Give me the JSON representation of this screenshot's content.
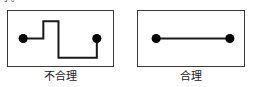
{
  "figure": {
    "clipped_header_text": "小。",
    "background_color": "#ffffff",
    "stroke_color": "#1a1a1a",
    "border_color": "#3a3a3a"
  },
  "panels": [
    {
      "id": "left",
      "caption": "不合理",
      "kind": "zigzag-routing",
      "nodes": [
        {
          "name": "node-a",
          "cx": 15,
          "cy": 27,
          "r": 4.5
        },
        {
          "name": "node-b",
          "cx": 88,
          "cy": 27,
          "r": 4.5
        }
      ],
      "path": "M15,27 L35,27 L35,10 L50,10 L50,46 L88,46 L88,27",
      "stroke_width": 2
    },
    {
      "id": "right",
      "caption": "合理",
      "kind": "straight-routing",
      "nodes": [
        {
          "name": "node-a",
          "cx": 18,
          "cy": 27,
          "r": 4.5
        },
        {
          "name": "node-b",
          "cx": 91,
          "cy": 27,
          "r": 4.5
        }
      ],
      "path": "M18,27 L91,27",
      "stroke_width": 2
    }
  ]
}
